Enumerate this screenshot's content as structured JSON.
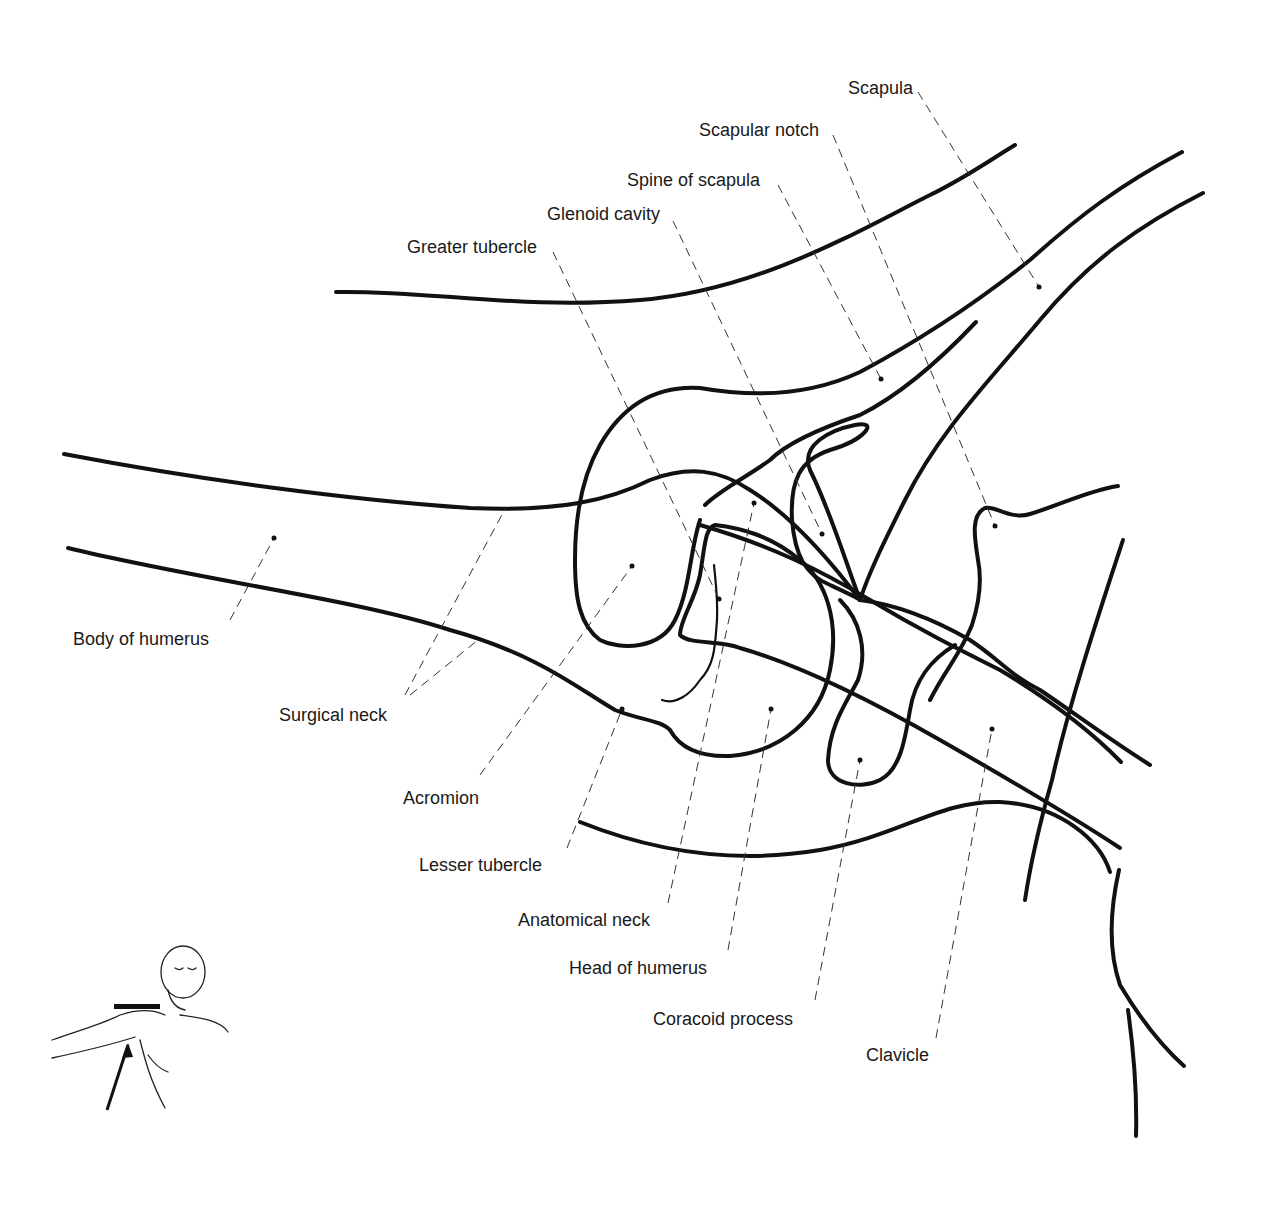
{
  "figure": {
    "type": "anatomical line drawing",
    "line_color": "#111111",
    "background": "#ffffff"
  },
  "labels": [
    {
      "id": "scapula",
      "text": "Scapula",
      "x": 848,
      "y": 79,
      "point": [
        1039,
        287
      ]
    },
    {
      "id": "scapular-notch",
      "text": "Scapular notch",
      "x": 699,
      "y": 121,
      "point": [
        995,
        526
      ]
    },
    {
      "id": "spine-of-scapula",
      "text": "Spine of scapula",
      "x": 627,
      "y": 171,
      "point": [
        881,
        379
      ]
    },
    {
      "id": "glenoid-cavity",
      "text": "Glenoid cavity",
      "x": 547,
      "y": 205,
      "point": [
        822,
        534
      ]
    },
    {
      "id": "greater-tubercle",
      "text": "Greater tubercle",
      "x": 407,
      "y": 238,
      "point": [
        719,
        599
      ]
    },
    {
      "id": "body-of-humerus",
      "text": "Body of humerus",
      "x": 73,
      "y": 630,
      "point": [
        274,
        538
      ]
    },
    {
      "id": "surgical-neck",
      "text": "Surgical neck",
      "x": 279,
      "y": 706,
      "point": [
        505,
        509
      ]
    },
    {
      "id": "acromion",
      "text": "Acromion",
      "x": 403,
      "y": 789,
      "point": [
        632,
        566
      ]
    },
    {
      "id": "lesser-tubercle",
      "text": "Lesser tubercle",
      "x": 419,
      "y": 856,
      "point": [
        622,
        709
      ]
    },
    {
      "id": "anatomical-neck",
      "text": "Anatomical neck",
      "x": 518,
      "y": 911,
      "point": [
        754,
        503
      ]
    },
    {
      "id": "head-of-humerus",
      "text": "Head of humerus",
      "x": 569,
      "y": 959,
      "point": [
        771,
        709
      ]
    },
    {
      "id": "coracoid-process",
      "text": "Coracoid process",
      "x": 653,
      "y": 1010,
      "point": [
        860,
        760
      ]
    },
    {
      "id": "clavicle",
      "text": "Clavicle",
      "x": 866,
      "y": 1046,
      "point": [
        992,
        729
      ]
    }
  ],
  "inset": {
    "description": "Patient positioning figure: arm abducted, beam arrow directed into axilla, film holder above shoulder",
    "icon": "patient-positioning-icon"
  }
}
